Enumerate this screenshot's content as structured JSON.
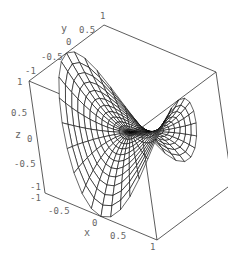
{
  "chart_data": {
    "type": "surface3d",
    "title": "",
    "xlabel": "x",
    "ylabel": "y",
    "zlabel": "z",
    "xlim": [
      -1,
      1
    ],
    "ylim": [
      -1,
      1
    ],
    "zlim": [
      -1,
      1
    ],
    "x_ticks": [
      "-1",
      "-0.5",
      "0",
      "0.5",
      "1"
    ],
    "y_ticks": [
      "-1",
      "-0.5",
      "0",
      "0.5",
      "1"
    ],
    "z_ticks": [
      "-1",
      "-0.5",
      "0",
      "0.5",
      "1"
    ],
    "mesh": {
      "radial_lines": 36,
      "rings": 12
    },
    "grid": false,
    "legend": null,
    "colors": {
      "line": "#000000",
      "box": "#333333",
      "text": "#666666"
    }
  },
  "labels": {
    "x_axis": "x",
    "y_axis": "y",
    "z_axis": "z",
    "x_ticks": [
      {
        "t": "-1",
        "x": 30,
        "y": 201
      },
      {
        "t": "-0.5",
        "x": 48,
        "y": 214
      },
      {
        "t": "0",
        "x": 92,
        "y": 226
      },
      {
        "t": "0.5",
        "x": 110,
        "y": 239
      },
      {
        "t": "1",
        "x": 150,
        "y": 250
      }
    ],
    "y_ticks": [
      {
        "t": "-1",
        "x": 25,
        "y": 74
      },
      {
        "t": "-0.5",
        "x": 41,
        "y": 60
      },
      {
        "t": "0",
        "x": 66,
        "y": 45
      },
      {
        "t": "0.5",
        "x": 79,
        "y": 33
      },
      {
        "t": "1",
        "x": 100,
        "y": 19
      }
    ],
    "z_ticks": [
      {
        "t": "1",
        "x": 17,
        "y": 85
      },
      {
        "t": "0.5",
        "x": 11,
        "y": 116
      },
      {
        "t": "0",
        "x": 27,
        "y": 142
      },
      {
        "t": "-0.5",
        "x": 14,
        "y": 167
      },
      {
        "t": "-1",
        "x": 30,
        "y": 190
      }
    ],
    "axis_label_positions": {
      "x": {
        "x": 84,
        "y": 236
      },
      "y": {
        "x": 61,
        "y": 32
      },
      "z": {
        "x": 15,
        "y": 138
      }
    }
  }
}
